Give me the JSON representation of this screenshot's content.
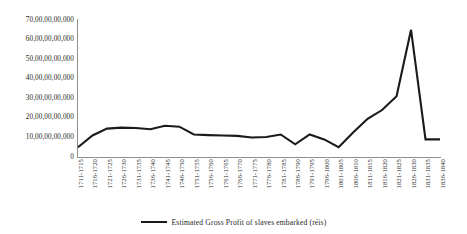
{
  "chart_data": {
    "type": "line",
    "title": "",
    "subtitle": "",
    "xlabel": "",
    "ylabel": "",
    "ylim": [
      0,
      7000000000
    ],
    "y_tick_labels": [
      "70,00,00,00,000",
      "60,00,00,00,000",
      "50,00,00,00,000",
      "40,00,00,00,000",
      "30,00,00,00,000",
      "20,00,00,00,000",
      "10,00,00,00,000",
      "0"
    ],
    "y_tick_values": [
      70,
      60,
      50,
      40,
      30,
      20,
      10,
      0
    ],
    "y_axis_unit_note": "values expressed in units of 1,00,00,00,000 (Indian digit grouping)",
    "grid": false,
    "legend_position": "bottom-center",
    "categories": [
      "1711-1715",
      "1716-1720",
      "1721-1725",
      "1726-1730",
      "1731-1735",
      "1736-1740",
      "1741-1745",
      "1746-1750",
      "1751-1755",
      "1756-1760",
      "1761-1765",
      "1766-1770",
      "1771-1775",
      "1776-1780",
      "1781-1785",
      "1786-1790",
      "1791-1795",
      "1796-1800",
      "1801-1805",
      "1806-1810",
      "1811-1815",
      "1816-1820",
      "1821-1825",
      "1826-1830",
      "1831-1835",
      "1836-1840"
    ],
    "series": [
      {
        "name": "Estimated  Gross Profit  of slaves embarked  (réis)",
        "color": "#1a1a1a",
        "values": [
          5.0,
          11.0,
          14.5,
          15.0,
          14.8,
          14.2,
          16.0,
          15.5,
          11.5,
          11.2,
          11.0,
          10.8,
          10.0,
          10.2,
          11.5,
          6.5,
          11.5,
          9.0,
          5.0,
          12.5,
          19.5,
          24.0,
          31.0,
          65.0,
          9.0,
          9.0
        ]
      }
    ]
  },
  "legend": {
    "entries": [
      {
        "label": "Estimated  Gross Profit  of slaves embarked  (réis)",
        "marker": "line-swatch",
        "color": "#1a1a1a"
      }
    ]
  },
  "colors": {
    "series": "#1a1a1a",
    "axis": "#8f8f8f",
    "text": "#262626",
    "background": "#ffffff"
  }
}
